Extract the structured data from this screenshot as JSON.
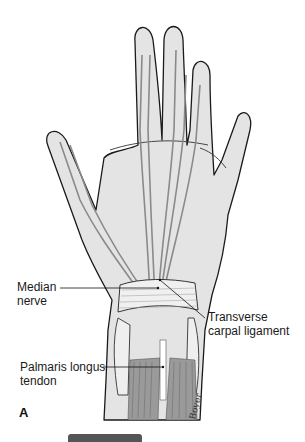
{
  "figure": {
    "panel_letter": "A",
    "labels": {
      "median_nerve": [
        "Median",
        "nerve"
      ],
      "transverse_carpal_ligament": [
        "Transverse",
        "carpal ligament"
      ],
      "palmaris_longus_tendon": [
        "Palmaris longus",
        "tendon"
      ]
    },
    "signature": "Boyer"
  },
  "colors": {
    "skin_fill": "#e4e4e4",
    "outline": "#1a1a1a",
    "nerve": "#8a8a8a",
    "muscle": "#8c8c8c",
    "bottom_bar": "#555555"
  }
}
